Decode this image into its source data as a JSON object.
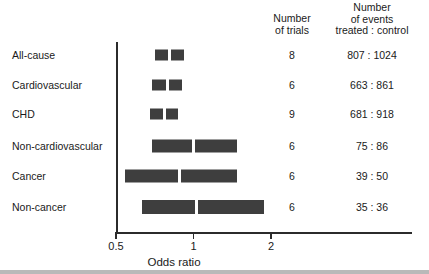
{
  "headers": {
    "trials": "Number\nof trials",
    "events": "Number\nof events\ntreated : control"
  },
  "axis": {
    "title": "Odds ratio",
    "ticks": [
      {
        "label": "0.5",
        "value": 0.5
      },
      {
        "label": "1",
        "value": 1
      },
      {
        "label": "2",
        "value": 2
      }
    ],
    "scale": "log",
    "xmin": 0.5,
    "xmax": 3.4
  },
  "style": {
    "bar_color": "#3e3e3e",
    "axis_color": "#2b2b2b",
    "text_color": "#1a1a1a",
    "background": "#ffffff"
  },
  "chart_data": {
    "type": "bar",
    "subtype": "forest-plot",
    "title": "",
    "xlabel": "Odds ratio",
    "ylabel": "",
    "xscale": "log",
    "xlim": [
      0.5,
      3.4
    ],
    "grid": false,
    "legend": null,
    "columns": [
      "Outcome",
      "Number of trials",
      "Number of events treated : control",
      "Odds ratio CI"
    ],
    "categories": [
      "All-cause",
      "Cardiovascular",
      "CHD",
      "Non-cardiovascular",
      "Cancer",
      "Non-cancer"
    ],
    "rows": [
      {
        "label": "All-cause",
        "trials": "8",
        "events": "807 : 1024",
        "ci_low": 0.71,
        "ci_high": 0.92,
        "estimate": 0.81
      },
      {
        "label": "Cardiovascular",
        "trials": "6",
        "events": "663 : 861",
        "ci_low": 0.69,
        "ci_high": 0.9,
        "estimate": 0.79
      },
      {
        "label": "CHD",
        "trials": "9",
        "events": "681 : 918",
        "ci_low": 0.68,
        "ci_high": 0.87,
        "estimate": 0.77
      },
      {
        "label": "Non-cardiovascular",
        "trials": "6",
        "events": "75 : 86",
        "ci_low": 0.69,
        "ci_high": 1.47,
        "estimate": 1.0
      },
      {
        "label": "Cancer",
        "trials": "6",
        "events": "39 : 50",
        "ci_low": 0.54,
        "ci_high": 1.47,
        "estimate": 0.88
      },
      {
        "label": "Non-cancer",
        "trials": "6",
        "events": "35 : 36",
        "ci_low": 0.63,
        "ci_high": 1.88,
        "estimate": 1.03
      }
    ]
  }
}
